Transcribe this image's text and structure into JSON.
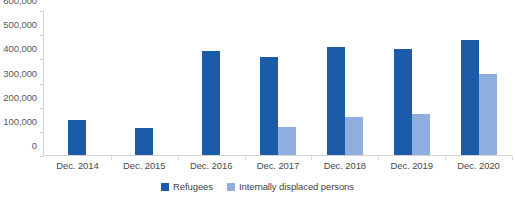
{
  "chart_data": {
    "type": "bar",
    "title": "",
    "subtitle": "",
    "xlabel": "",
    "ylabel": "",
    "categories": [
      "Dec. 2014",
      "Dec. 2015",
      "Dec. 2016",
      "Dec. 2017",
      "Dec. 2018",
      "Dec. 2019",
      "Dec. 2020"
    ],
    "series": [
      {
        "name": "Refugees",
        "color": "#1c5ba8",
        "values": [
          148000,
          116000,
          433000,
          410000,
          453000,
          443000,
          481000
        ]
      },
      {
        "name": "Internally displaced persons",
        "color": "#8eaedd",
        "values": [
          0,
          0,
          0,
          118000,
          163000,
          175000,
          339000
        ]
      }
    ],
    "ylim": [
      0,
      600000
    ],
    "ytick_values": [
      0,
      100000,
      200000,
      300000,
      400000,
      500000,
      600000
    ],
    "ytick_labels": [
      "0",
      "100,000",
      "200,000",
      "300,000",
      "400,000",
      "500,000",
      "600,000"
    ],
    "grid": false,
    "legend_position": "bottom",
    "annotations": []
  },
  "legend": {
    "items": [
      {
        "label": "Refugees",
        "color": "#1c5ba8"
      },
      {
        "label": "Internally displaced persons",
        "color": "#8eaedd"
      }
    ]
  },
  "colors": {
    "refugees": "#1c5ba8",
    "internally_displaced_persons": "#8eaedd",
    "axis_line": "#d4d4d4",
    "axis_text": "#5a5a5a",
    "background": "#ffffff"
  }
}
